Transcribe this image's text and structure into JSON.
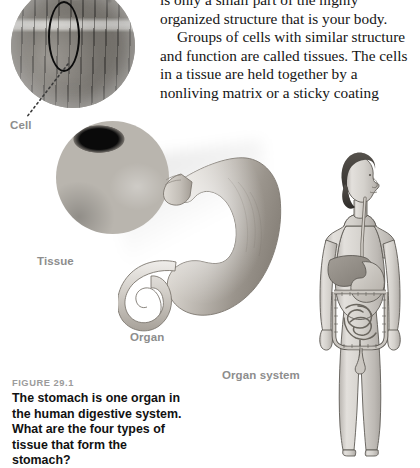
{
  "page": {
    "figure_number": "FIGURE 29.1",
    "caption": "The stomach is one organ in the human digestive system. What are the four types of tissue that form the stomach?"
  },
  "body_text": {
    "paragraphs": [
      "is only a small part of the highly organized structure that is your body.",
      "Groups of cells with similar structure and function are called tissues. The cells in a tissue are held together by a nonliving matrix or a sticky coating"
    ]
  },
  "labels": {
    "cell": "Cell",
    "tissue": "Tissue",
    "organ": "Organ",
    "organ_system": "Organ system"
  },
  "figures": {
    "cell_micrograph": "light-micrograph-of-muscle-cells",
    "cell_highlight": "black-ellipse-outline-around-one-cell",
    "cell_leader": "dotted-leader-line",
    "tissue_micrograph": "electron-micrograph-of-tissue",
    "stomach": "grayscale-stomach-organ-illustration",
    "human_body": "grayscale-human-figure-with-digestive-system"
  },
  "colors": {
    "label_gray": "#8d8d8d",
    "figure_number_gray": "#9b9b9b",
    "caption_black": "#111111",
    "body_text_black": "#151515",
    "organ_fill_light": "#cfcbc5",
    "organ_fill_dark": "#8f8a84",
    "skin_fill": "#d9d6d1",
    "outline": "#4a4742"
  }
}
